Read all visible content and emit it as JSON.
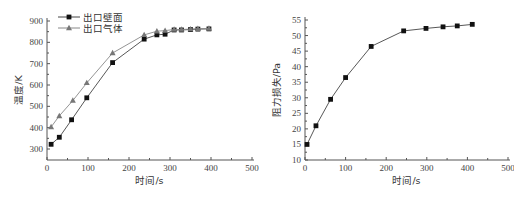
{
  "chart_data": [
    {
      "type": "line",
      "title": "",
      "xlabel": "时间/s",
      "ylabel": "温度/K",
      "xlim": [
        0,
        500
      ],
      "ylim": [
        280,
        900
      ],
      "xticks": [
        0,
        100,
        200,
        300,
        400,
        500
      ],
      "yticks": [
        300,
        400,
        500,
        600,
        700,
        800,
        900
      ],
      "grid": false,
      "legend_position": "upper left",
      "series": [
        {
          "name": "出口壁面",
          "marker": "square",
          "color": "#111111",
          "x": [
            10,
            30,
            60,
            97,
            160,
            237,
            268,
            288,
            310,
            328,
            350,
            368,
            395
          ],
          "y": [
            322,
            355,
            437,
            540,
            705,
            815,
            835,
            838,
            858,
            858,
            860,
            862,
            863
          ]
        },
        {
          "name": "出口气体",
          "marker": "triangle",
          "color": "#777777",
          "x": [
            10,
            30,
            63,
            97,
            160,
            237,
            268,
            288,
            310,
            328,
            350,
            368,
            395
          ],
          "y": [
            403,
            455,
            527,
            610,
            750,
            835,
            852,
            855,
            860,
            860,
            862,
            864,
            865
          ]
        }
      ]
    },
    {
      "type": "line",
      "title": "",
      "xlabel": "时间/s",
      "ylabel": "阻力损失/Pa",
      "xlim": [
        0,
        500
      ],
      "ylim": [
        10,
        55
      ],
      "xticks": [
        0,
        100,
        200,
        300,
        400,
        500
      ],
      "yticks": [
        10,
        15,
        20,
        25,
        30,
        35,
        40,
        45,
        50,
        55
      ],
      "grid": false,
      "series": [
        {
          "name": "阻力损失",
          "marker": "square",
          "color": "#111111",
          "x": [
            5,
            27,
            63,
            100,
            163,
            243,
            298,
            340,
            375,
            412
          ],
          "y": [
            15.0,
            21.0,
            29.5,
            36.5,
            46.5,
            51.5,
            52.3,
            52.8,
            53.1,
            53.6
          ]
        }
      ]
    }
  ]
}
